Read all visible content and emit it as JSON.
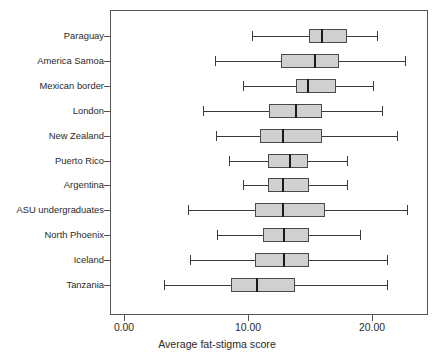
{
  "chart_data": {
    "type": "boxplot",
    "title": "",
    "xlabel": "Average fat-stigma score",
    "ylabel": "",
    "orientation": "horizontal",
    "xlim": [
      -1.0,
      24.5
    ],
    "grid": false,
    "legend": null,
    "xticks": [
      0,
      10,
      20
    ],
    "xticklabels": [
      "0.00",
      "10.00",
      "20.00"
    ],
    "categories": [
      "Paraguay",
      "America Samoa",
      "Mexican  border",
      "London",
      "New Zealand",
      "Puerto Rico",
      "Argentina",
      "ASU undergraduates",
      "North Phoenix",
      "Iceland",
      "Tanzania"
    ],
    "stat_names": [
      "min",
      "q1",
      "median",
      "q3",
      "max"
    ],
    "boxes": [
      {
        "category": "Paraguay",
        "min": 10.3,
        "q1": 14.9,
        "median": 16.0,
        "q3": 18.0,
        "max": 20.4
      },
      {
        "category": "America Samoa",
        "min": 7.3,
        "q1": 12.7,
        "median": 15.4,
        "q3": 17.3,
        "max": 22.7
      },
      {
        "category": "Mexican  border",
        "min": 9.6,
        "q1": 13.9,
        "median": 14.8,
        "q3": 17.1,
        "max": 20.1
      },
      {
        "category": "London",
        "min": 6.4,
        "q1": 11.7,
        "median": 13.9,
        "q3": 16.0,
        "max": 20.8
      },
      {
        "category": "New Zealand",
        "min": 7.4,
        "q1": 11.0,
        "median": 12.8,
        "q3": 16.0,
        "max": 22.0
      },
      {
        "category": "Puerto Rico",
        "min": 8.5,
        "q1": 11.6,
        "median": 13.4,
        "q3": 14.8,
        "max": 18.0
      },
      {
        "category": "Argentina",
        "min": 9.6,
        "q1": 11.6,
        "median": 12.8,
        "q3": 14.9,
        "max": 18.0
      },
      {
        "category": "ASU undergraduates",
        "min": 5.2,
        "q1": 10.6,
        "median": 12.8,
        "q3": 16.2,
        "max": 22.8
      },
      {
        "category": "North Phoenix",
        "min": 7.5,
        "q1": 11.2,
        "median": 12.9,
        "q3": 14.9,
        "max": 19.0
      },
      {
        "category": "Iceland",
        "min": 5.3,
        "q1": 10.6,
        "median": 12.9,
        "q3": 14.9,
        "max": 21.2
      },
      {
        "category": "Tanzania",
        "min": 3.2,
        "q1": 8.6,
        "median": 10.7,
        "q3": 13.8,
        "max": 21.2
      }
    ],
    "colors": {
      "box_fill": "#d0d0d0",
      "box_edge": "#4a4a4a",
      "median_line": "#1a1a1a",
      "whisker": "#3a3a3a",
      "axis": "#555555",
      "text": "#2a2a2a",
      "background": "#ffffff"
    }
  }
}
